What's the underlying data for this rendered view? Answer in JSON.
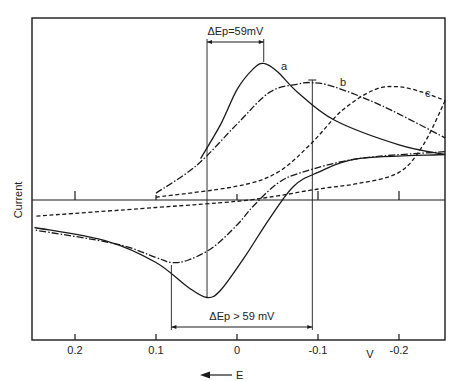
{
  "chart_data": {
    "type": "line",
    "title": "",
    "xlabel": "E",
    "x_unit": "V",
    "ylabel": "Current",
    "xlim": [
      0.25,
      -0.26
    ],
    "ylim": [
      -1.0,
      1.0
    ],
    "x_direction": "decreasing (positive potential on left)",
    "x_ticks": [
      0.2,
      0.1,
      0,
      -0.1,
      -0.2
    ],
    "x_tick_labels": [
      "0.2",
      "0.1",
      "0",
      "-0.1",
      "-0.2"
    ],
    "grid": false,
    "legend": "inline curve labels",
    "arrow_label": "E",
    "annotations": [
      {
        "name": "reversible",
        "text": "ΔEp=59mV",
        "from_x": 0.037,
        "to_x": -0.033,
        "position": "top"
      },
      {
        "name": "quasi-reversible",
        "text": "ΔEp > 59 mV",
        "from_x": 0.081,
        "to_x": -0.093,
        "position": "bottom"
      }
    ],
    "series": [
      {
        "name": "a",
        "style": "solid",
        "forward": {
          "x": [
            0.045,
            0.02,
            0.0,
            -0.02,
            -0.033,
            -0.05,
            -0.075,
            -0.12,
            -0.2,
            -0.257
          ],
          "y": [
            0.3,
            0.55,
            0.8,
            0.95,
            0.99,
            0.93,
            0.78,
            0.58,
            0.4,
            0.33
          ]
        },
        "reverse": {
          "x": [
            -0.257,
            -0.15,
            -0.1,
            -0.07,
            -0.04,
            -0.01,
            0.02,
            0.037,
            0.06,
            0.1,
            0.16,
            0.25
          ],
          "y": [
            0.33,
            0.3,
            0.2,
            0.1,
            -0.15,
            -0.45,
            -0.72,
            -0.78,
            -0.7,
            -0.5,
            -0.33,
            -0.22
          ]
        }
      },
      {
        "name": "b",
        "style": "dash-dot",
        "forward": {
          "x": [
            0.1,
            0.05,
            0.0,
            -0.04,
            -0.075,
            -0.093,
            -0.12,
            -0.18,
            -0.257
          ],
          "y": [
            0.05,
            0.25,
            0.55,
            0.78,
            0.84,
            0.85,
            0.82,
            0.68,
            0.45
          ]
        },
        "reverse": {
          "x": [
            -0.257,
            -0.15,
            -0.08,
            -0.05,
            -0.02,
            0.0,
            0.03,
            0.06,
            0.081,
            0.1,
            0.15,
            0.25
          ],
          "y": [
            0.35,
            0.3,
            0.2,
            0.12,
            -0.05,
            -0.2,
            -0.38,
            -0.48,
            -0.5,
            -0.46,
            -0.35,
            -0.24
          ]
        }
      },
      {
        "name": "c",
        "style": "dashed",
        "forward": {
          "x": [
            0.1,
            0.0,
            -0.05,
            -0.09,
            -0.13,
            -0.17,
            -0.2,
            -0.23,
            -0.257
          ],
          "y": [
            0.02,
            0.1,
            0.2,
            0.4,
            0.65,
            0.8,
            0.82,
            0.78,
            0.72
          ]
        },
        "reverse": {
          "x": [
            -0.257,
            -0.23,
            -0.2,
            -0.15,
            -0.1,
            -0.05,
            0.0,
            0.1,
            0.25
          ],
          "y": [
            0.72,
            0.4,
            0.2,
            0.12,
            0.08,
            0.03,
            -0.01,
            -0.06,
            -0.13
          ]
        }
      }
    ]
  }
}
